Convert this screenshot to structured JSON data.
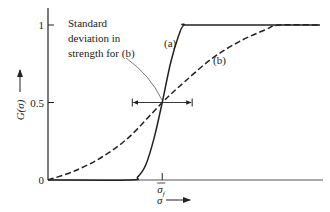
{
  "chart_data": {
    "type": "line",
    "title": "",
    "xlabel": "σ",
    "ylabel": "G(σ)",
    "yticks": [
      {
        "value": 0,
        "label": "0"
      },
      {
        "value": 0.5,
        "label": "0.5"
      },
      {
        "value": 1,
        "label": "1"
      }
    ],
    "xticks": [
      {
        "value": 0.42,
        "label": "σ_f",
        "label_main": "σ",
        "label_sub": "f"
      }
    ],
    "xlim": [
      0,
      1
    ],
    "ylim": [
      0,
      1
    ],
    "grid": false,
    "series": [
      {
        "name": "(a)",
        "style": "solid",
        "x": [
          0,
          0.3,
          0.33,
          0.36,
          0.39,
          0.42,
          0.45,
          0.48,
          0.5,
          0.54,
          1.0
        ],
        "y": [
          0,
          0,
          0.02,
          0.1,
          0.27,
          0.5,
          0.75,
          0.93,
          1.0,
          1.0,
          1.0
        ]
      },
      {
        "name": "(b)",
        "style": "dashed",
        "x": [
          0,
          0.1,
          0.2,
          0.3,
          0.42,
          0.5,
          0.6,
          0.7,
          0.8,
          0.85,
          1.0
        ],
        "y": [
          0,
          0.06,
          0.15,
          0.28,
          0.5,
          0.63,
          0.78,
          0.89,
          0.97,
          1.0,
          1.0
        ]
      }
    ],
    "annotations": {
      "std_text": [
        "Standard",
        "deviation in",
        "strength for (b)"
      ],
      "std_bracket": {
        "y": 0.5,
        "x_from": 0.31,
        "x_to": 0.53
      },
      "label_a": "(a)",
      "label_b": "(b)"
    }
  }
}
